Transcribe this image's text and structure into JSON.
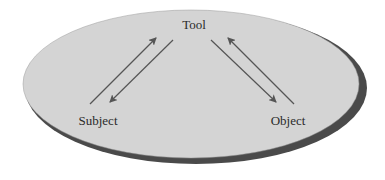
{
  "diagram": {
    "title": "",
    "nodes": [
      {
        "id": "tool",
        "label": "Tool"
      },
      {
        "id": "subject",
        "label": "Subject"
      },
      {
        "id": "object",
        "label": "Object"
      }
    ],
    "edges": [
      {
        "from": "subject",
        "to": "tool"
      },
      {
        "from": "tool",
        "to": "subject"
      },
      {
        "from": "tool",
        "to": "object"
      },
      {
        "from": "object",
        "to": "tool"
      }
    ],
    "colors": {
      "ellipse_fill": "#d4d4d4",
      "ellipse_shadow": "#4a4a4a",
      "arrow": "#555555",
      "text": "#2a2a2a"
    }
  }
}
